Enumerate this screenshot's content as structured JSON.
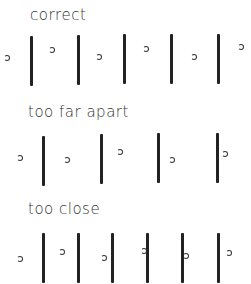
{
  "sections": [
    {
      "label": "correct",
      "label_pos": [
        30,
        6
      ],
      "bars": [
        [
          30,
          36
        ],
        [
          77,
          35
        ],
        [
          123,
          34
        ],
        [
          170,
          34
        ],
        [
          217,
          34
        ]
      ],
      "bar_height": 50,
      "hooks": [
        [
          4,
          55
        ],
        [
          49,
          47
        ],
        [
          96,
          54
        ],
        [
          143,
          46
        ],
        [
          191,
          54
        ],
        [
          238,
          44
        ]
      ]
    },
    {
      "label": "too far apart",
      "label_pos": [
        28,
        103
      ],
      "bars": [
        [
          42,
          136
        ],
        [
          100,
          134
        ],
        [
          157,
          133
        ],
        [
          216,
          133
        ]
      ],
      "bar_height": 50,
      "hooks": [
        [
          17,
          155
        ],
        [
          64,
          157
        ],
        [
          117,
          149
        ],
        [
          169,
          157
        ],
        [
          222,
          151
        ]
      ]
    },
    {
      "label": "too close",
      "label_pos": [
        28,
        200
      ],
      "bars": [
        [
          42,
          233
        ],
        [
          77,
          233
        ],
        [
          111,
          233
        ],
        [
          146,
          233
        ],
        [
          181,
          233
        ],
        [
          217,
          233
        ]
      ],
      "bar_height": 50,
      "hooks": [
        [
          17,
          256
        ],
        [
          59,
          249
        ],
        [
          101,
          255
        ],
        [
          141,
          248
        ],
        [
          183,
          253
        ],
        [
          226,
          250
        ]
      ]
    }
  ]
}
